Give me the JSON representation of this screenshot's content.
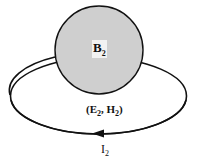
{
  "diagram": {
    "body_label": "B",
    "body_label_sub": "2",
    "field_label_prefix": "(E",
    "field_label_sub1": "2",
    "field_label_mid": ", H",
    "field_label_sub2": "2",
    "field_label_suffix": ")",
    "current_label": "I",
    "current_label_sub": "2",
    "colors": {
      "body_fill": "#cfcfcf",
      "stroke": "#111111",
      "background": "#ffffff"
    },
    "current_direction": "counterclockwise (arrow pointing left at bottom)"
  }
}
